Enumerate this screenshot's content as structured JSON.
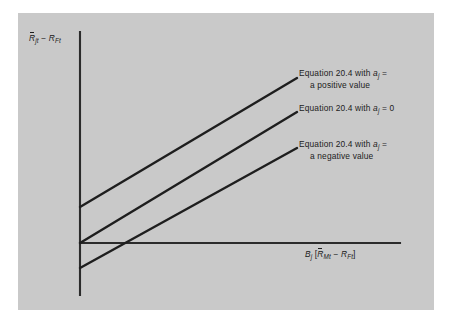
{
  "figure": {
    "type": "line-diagram",
    "background_color": "#c9c9c9",
    "page_color": "#ffffff",
    "line_color": "#1e1e1e",
    "axis_color": "#2b2b2b"
  },
  "axes": {
    "y_label": {
      "full_text": "R̄jt − RFt",
      "symbol_1": "R",
      "sub_1": "jt",
      "operator": "−",
      "symbol_2": "R",
      "sub_2": "Ft"
    },
    "x_label": {
      "full_text": "Bj [R̄Mt − RFt]",
      "symbol_beta": "B",
      "sub_beta": "j",
      "bracket_open": "[",
      "symbol_1": "R",
      "sub_1": "Mt",
      "operator": "−",
      "symbol_2": "R",
      "sub_2": "Ft",
      "bracket_close": "]"
    }
  },
  "annotations": [
    {
      "id": "positive",
      "line1_prefix": "Equation 20.4 with",
      "alpha_symbol": "a",
      "alpha_sub": "j",
      "equals": "=",
      "line2": "a positive value"
    },
    {
      "id": "zero",
      "line1_prefix": "Equation 20.4 with",
      "alpha_symbol": "a",
      "alpha_sub": "j",
      "equals": "= 0",
      "line2": ""
    },
    {
      "id": "negative",
      "line1_prefix": "Equation 20.4 with",
      "alpha_symbol": "a",
      "alpha_sub": "j",
      "equals": "=",
      "line2": "a negative value"
    }
  ],
  "chart_data": {
    "type": "line",
    "title": "",
    "xlabel": "Bj [R̄Mt − RFt]",
    "ylabel": "R̄jt − RFt",
    "grid": false,
    "legend_position": "inline-annotations",
    "origin_px": {
      "x": 80,
      "y": 243
    },
    "axis_extent_px": {
      "y_top": 32,
      "y_bottom": 295,
      "x_left": 80,
      "x_right": 400
    },
    "series": [
      {
        "name": "Equation 20.4 with aj = a positive value",
        "intercept_sign": "positive",
        "x_px": [
          80,
          297
        ],
        "y_px": [
          207,
          78
        ]
      },
      {
        "name": "Equation 20.4 with aj = 0",
        "intercept_sign": "zero",
        "x_px": [
          80,
          297
        ],
        "y_px": [
          243,
          112
        ]
      },
      {
        "name": "Equation 20.4 with aj = a negative value",
        "intercept_sign": "negative",
        "x_px": [
          80,
          297
        ],
        "y_px": [
          268,
          148
        ]
      }
    ]
  }
}
